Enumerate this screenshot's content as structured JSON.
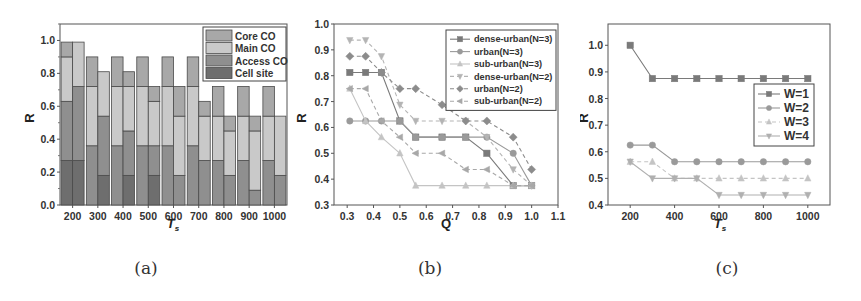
{
  "captions": [
    "(a)",
    "(b)",
    "(c)"
  ],
  "chart_data": [
    {
      "id": "a",
      "type": "bar",
      "stacked": true,
      "title": "",
      "xlabel": "T_s",
      "ylabel": "R",
      "ylim": [
        0,
        1.1
      ],
      "yticks": [
        0.0,
        0.2,
        0.4,
        0.6,
        0.8,
        1.0
      ],
      "categories": [
        "200",
        "300",
        "400",
        "500",
        "600",
        "700",
        "800",
        "900",
        "1000"
      ],
      "bars_per_category": 2,
      "legend": {
        "position": "upper right",
        "entries": [
          "Core CO",
          "Main CO",
          "Access CO",
          "Cell site"
        ]
      },
      "colors": {
        "Cell site": "#6e6e6e",
        "Access CO": "#8f8f8f",
        "Main CO": "#c9c9c9",
        "Core CO": "#a8a8a8"
      },
      "series": [
        {
          "name": "Cell site",
          "left": [
            0.27,
            0,
            0,
            0,
            0,
            0,
            0,
            0,
            0
          ],
          "right": [
            0.27,
            0.18,
            0.18,
            0.18,
            0,
            0,
            0,
            0,
            0
          ]
        },
        {
          "name": "Access CO",
          "left": [
            0.36,
            0.36,
            0.36,
            0.36,
            0.36,
            0.36,
            0.27,
            0.27,
            0.27
          ],
          "right": [
            0.45,
            0.36,
            0.27,
            0.18,
            0.18,
            0.27,
            0.18,
            0.09,
            0.18
          ]
        },
        {
          "name": "Main CO",
          "left": [
            0.27,
            0.36,
            0.36,
            0.36,
            0.36,
            0.36,
            0.27,
            0.27,
            0.27
          ],
          "right": [
            0.27,
            0.27,
            0.27,
            0.27,
            0.36,
            0.27,
            0.27,
            0.36,
            0.36
          ]
        },
        {
          "name": "Core CO",
          "left": [
            0.09,
            0.18,
            0.18,
            0.18,
            0.18,
            0.18,
            0.18,
            0.18,
            0.18
          ],
          "right": [
            0,
            0,
            0.09,
            0.09,
            0.18,
            0.09,
            0.09,
            0.09,
            0
          ]
        }
      ]
    },
    {
      "id": "b",
      "type": "line",
      "title": "",
      "xlabel": "Q",
      "ylabel": "R",
      "xlim": [
        0.25,
        1.1
      ],
      "ylim": [
        0.3,
        1.0
      ],
      "xticks": [
        0.3,
        0.4,
        0.5,
        0.6,
        0.7,
        0.8,
        0.9,
        1.0,
        1.1
      ],
      "yticks": [
        0.3,
        0.4,
        0.5,
        0.6,
        0.7,
        0.8,
        0.9,
        1.0
      ],
      "legend": {
        "position": "upper right",
        "entries": [
          "dense-urban(N=3)",
          "urban(N=3)",
          "sub-urban(N=3)",
          "dense-urban(N=2)",
          "urban(N=2)",
          "sub-urban(N=2)"
        ]
      },
      "series": [
        {
          "name": "dense-urban(N=3)",
          "marker": "square",
          "dash": "solid",
          "color": "#7a7a7a",
          "x": [
            0.31,
            0.37,
            0.43,
            0.5,
            0.56,
            0.66,
            0.75,
            0.83,
            0.93,
            1.0
          ],
          "y": [
            0.8125,
            0.8125,
            0.8125,
            0.625,
            0.5625,
            0.5625,
            0.5625,
            0.5,
            0.375,
            0.375
          ]
        },
        {
          "name": "urban(N=3)",
          "marker": "circle",
          "dash": "solid",
          "color": "#9a9a9a",
          "x": [
            0.31,
            0.37,
            0.43,
            0.5,
            0.56,
            0.66,
            0.75,
            0.83,
            0.93,
            1.0
          ],
          "y": [
            0.625,
            0.625,
            0.625,
            0.625,
            0.5625,
            0.5625,
            0.5625,
            0.5625,
            0.5,
            0.375
          ]
        },
        {
          "name": "sub-urban(N=3)",
          "marker": "triangle-up",
          "dash": "solid",
          "color": "#c4c4c4",
          "x": [
            0.31,
            0.37,
            0.43,
            0.5,
            0.56,
            0.66,
            0.75,
            0.83,
            0.93,
            1.0
          ],
          "y": [
            0.75,
            0.625,
            0.5625,
            0.5,
            0.375,
            0.375,
            0.375,
            0.375,
            0.375,
            0.375
          ]
        },
        {
          "name": "dense-urban(N=2)",
          "marker": "triangle-down",
          "dash": "dash",
          "color": "#b4b4b4",
          "x": [
            0.31,
            0.37,
            0.43,
            0.5,
            0.56,
            0.66,
            0.75,
            0.83,
            0.93,
            1.0
          ],
          "y": [
            0.9375,
            0.9375,
            0.875,
            0.6875,
            0.625,
            0.625,
            0.625,
            0.5625,
            0.4375,
            0.375
          ]
        },
        {
          "name": "urban(N=2)",
          "marker": "diamond",
          "dash": "dash",
          "color": "#8c8c8c",
          "x": [
            0.31,
            0.37,
            0.43,
            0.5,
            0.56,
            0.66,
            0.75,
            0.83,
            0.93,
            1.0
          ],
          "y": [
            0.875,
            0.875,
            0.8125,
            0.75,
            0.75,
            0.6875,
            0.625,
            0.625,
            0.5625,
            0.4375
          ]
        },
        {
          "name": "sub-urban(N=2)",
          "marker": "triangle-left",
          "dash": "dash",
          "color": "#a8a8a8",
          "x": [
            0.31,
            0.37,
            0.43,
            0.5,
            0.56,
            0.66,
            0.75,
            0.83,
            0.93,
            1.0
          ],
          "y": [
            0.75,
            0.75,
            0.625,
            0.5625,
            0.5,
            0.5,
            0.4375,
            0.4375,
            0.375,
            0.375
          ]
        }
      ]
    },
    {
      "id": "c",
      "type": "line",
      "title": "",
      "xlabel": "T_s",
      "ylabel": "R",
      "xlim": [
        100,
        1100
      ],
      "ylim": [
        0.4,
        1.08
      ],
      "xticks": [
        200,
        400,
        600,
        800,
        1000
      ],
      "yticks": [
        0.4,
        0.5,
        0.6,
        0.7,
        0.8,
        0.9,
        1.0
      ],
      "legend": {
        "position": "center right",
        "entries": [
          "W=1",
          "W=2",
          "W=3",
          "W=4"
        ]
      },
      "series": [
        {
          "name": "W=1",
          "marker": "square",
          "dash": "solid",
          "color": "#7a7a7a",
          "x": [
            200,
            300,
            400,
            500,
            600,
            700,
            800,
            900,
            1000
          ],
          "y": [
            1.0,
            0.875,
            0.875,
            0.875,
            0.875,
            0.875,
            0.875,
            0.875,
            0.875
          ]
        },
        {
          "name": "W=2",
          "marker": "circle",
          "dash": "solid",
          "color": "#9a9a9a",
          "x": [
            200,
            300,
            400,
            500,
            600,
            700,
            800,
            900,
            1000
          ],
          "y": [
            0.625,
            0.625,
            0.5625,
            0.5625,
            0.5625,
            0.5625,
            0.5625,
            0.5625,
            0.5625
          ]
        },
        {
          "name": "W=3",
          "marker": "triangle-up",
          "dash": "dash",
          "color": "#c4c4c4",
          "x": [
            200,
            300,
            400,
            500,
            600,
            700,
            800,
            900,
            1000
          ],
          "y": [
            0.5625,
            0.5625,
            0.5,
            0.5,
            0.5,
            0.5,
            0.5,
            0.5,
            0.5
          ]
        },
        {
          "name": "W=4",
          "marker": "triangle-down",
          "dash": "solid",
          "color": "#b0b0b0",
          "x": [
            200,
            300,
            400,
            500,
            600,
            700,
            800,
            900,
            1000
          ],
          "y": [
            0.5625,
            0.5,
            0.5,
            0.5,
            0.4375,
            0.4375,
            0.4375,
            0.4375,
            0.4375
          ]
        }
      ]
    }
  ]
}
